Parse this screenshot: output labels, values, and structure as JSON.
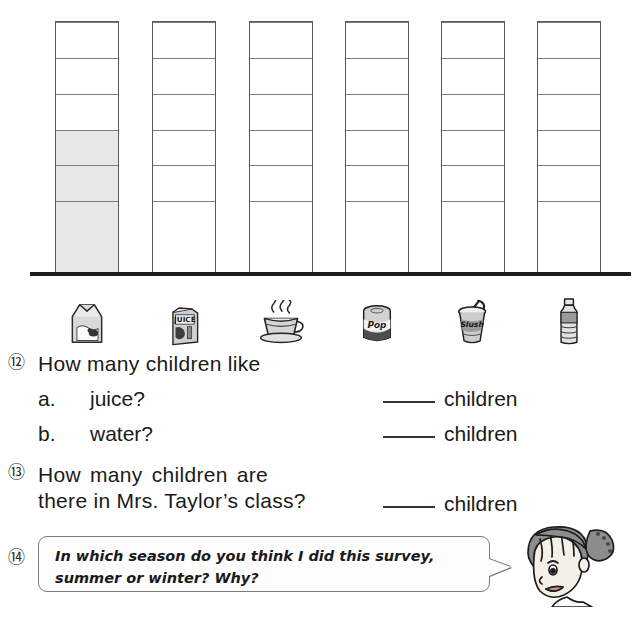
{
  "chart_data": {
    "type": "bar",
    "title": "",
    "xlabel": "",
    "ylabel": "",
    "grid": true,
    "legend": false,
    "ylim": [
      0,
      7
    ],
    "cells_per_column": 7,
    "categories": [
      "milk",
      "juice",
      "tea",
      "pop",
      "slush",
      "water"
    ],
    "category_icons": [
      "milk-carton-icon",
      "juice-box-icon",
      "teacup-icon",
      "pop-can-icon",
      "slush-cup-icon",
      "water-bottle-icon"
    ],
    "icon_labels": [
      "",
      "JUICE",
      "",
      "Pop",
      "Slush",
      ""
    ],
    "values": [
      4,
      0,
      0,
      0,
      0,
      0
    ],
    "filled_color": "#e7e7e7",
    "empty_color": "#ffffff",
    "grid_line_color": "#7d7d7d",
    "border_color": "#595959",
    "baseline_color": "#1b1b1b"
  },
  "questions": [
    {
      "number": "⑫",
      "prompt": "How many children like",
      "sub_items": [
        {
          "label": "a.",
          "text": "juice?",
          "answer_value": "",
          "answer_unit": "children"
        },
        {
          "label": "b.",
          "text": "water?",
          "answer_value": "",
          "answer_unit": "children"
        }
      ]
    },
    {
      "number": "⑬",
      "line1": "How many children are",
      "line2": "there in Mrs. Taylor’s class?",
      "answer_value": "",
      "answer_unit": "children"
    },
    {
      "number": "⑭",
      "bubble_text": "In which season do you think I did this survey, summer or winter?  Why?",
      "character": "teacher-character"
    }
  ]
}
